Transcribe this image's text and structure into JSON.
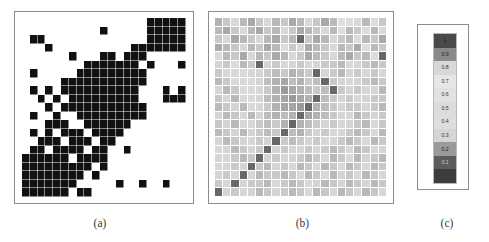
{
  "figure": {
    "background": "#ffffff",
    "panels": [
      {
        "id": "a",
        "caption": "(a)",
        "kind": "binary-adjacency-matrix"
      },
      {
        "id": "b",
        "caption": "(b)",
        "kind": "grayscale-similarity-matrix"
      },
      {
        "id": "c",
        "caption": "(c)",
        "kind": "colorbar-legend"
      }
    ]
  },
  "colors": {
    "frame_border": "#8c8c8c",
    "binary_on": "#111111",
    "binary_off": "#ffffff",
    "grid_line": "#ffffff",
    "caption_text": "#3a3a3a"
  },
  "chart_data": [
    {
      "type": "heatmap",
      "panel": "a",
      "title": "(a)",
      "subtitle": "",
      "xlabel": "",
      "ylabel": "",
      "legend_position": "none",
      "grid": true,
      "colormap": "binary",
      "value_labels": {
        "0": "absent",
        "1": "present"
      },
      "zlim": [
        0,
        1
      ],
      "rows": 21,
      "cols": 21,
      "x": [
        1,
        2,
        3,
        4,
        5,
        6,
        7,
        8,
        9,
        10,
        11,
        12,
        13,
        14,
        15,
        16,
        17,
        18,
        19,
        20,
        21
      ],
      "y": [
        1,
        2,
        3,
        4,
        5,
        6,
        7,
        8,
        9,
        10,
        11,
        12,
        13,
        14,
        15,
        16,
        17,
        18,
        19,
        20,
        21
      ],
      "values": [
        [
          0,
          0,
          0,
          0,
          0,
          0,
          0,
          0,
          0,
          0,
          0,
          0,
          0,
          0,
          0,
          0,
          1,
          1,
          1,
          1,
          1
        ],
        [
          0,
          0,
          0,
          0,
          0,
          0,
          0,
          0,
          0,
          0,
          1,
          0,
          0,
          0,
          0,
          0,
          1,
          1,
          1,
          1,
          1
        ],
        [
          0,
          1,
          1,
          0,
          0,
          0,
          0,
          0,
          0,
          0,
          0,
          0,
          0,
          0,
          0,
          0,
          1,
          1,
          1,
          1,
          1
        ],
        [
          0,
          0,
          0,
          1,
          0,
          0,
          0,
          0,
          0,
          0,
          0,
          0,
          0,
          0,
          1,
          1,
          1,
          1,
          1,
          1,
          1
        ],
        [
          0,
          0,
          0,
          0,
          0,
          0,
          1,
          0,
          0,
          0,
          1,
          1,
          0,
          1,
          1,
          1,
          0,
          0,
          0,
          0,
          0
        ],
        [
          0,
          0,
          0,
          0,
          0,
          0,
          0,
          0,
          1,
          1,
          1,
          1,
          1,
          1,
          1,
          0,
          1,
          0,
          0,
          0,
          1
        ],
        [
          0,
          1,
          0,
          0,
          0,
          0,
          0,
          1,
          1,
          1,
          1,
          1,
          1,
          1,
          1,
          1,
          0,
          0,
          0,
          0,
          0
        ],
        [
          0,
          0,
          0,
          0,
          0,
          1,
          1,
          1,
          1,
          1,
          1,
          1,
          1,
          1,
          1,
          1,
          0,
          0,
          0,
          0,
          0
        ],
        [
          0,
          1,
          0,
          1,
          0,
          1,
          1,
          1,
          1,
          1,
          1,
          1,
          1,
          1,
          1,
          0,
          0,
          0,
          1,
          0,
          1
        ],
        [
          0,
          0,
          1,
          0,
          1,
          0,
          1,
          1,
          1,
          1,
          1,
          1,
          1,
          1,
          1,
          0,
          0,
          0,
          1,
          1,
          1
        ],
        [
          0,
          0,
          0,
          1,
          0,
          1,
          1,
          1,
          1,
          1,
          1,
          1,
          1,
          1,
          1,
          1,
          0,
          0,
          0,
          0,
          0
        ],
        [
          0,
          1,
          0,
          0,
          1,
          0,
          0,
          1,
          1,
          1,
          1,
          1,
          1,
          1,
          1,
          1,
          0,
          0,
          0,
          0,
          0
        ],
        [
          0,
          0,
          0,
          1,
          1,
          1,
          0,
          0,
          1,
          1,
          1,
          1,
          1,
          1,
          0,
          0,
          0,
          0,
          0,
          0,
          0
        ],
        [
          0,
          1,
          0,
          1,
          0,
          1,
          1,
          1,
          0,
          1,
          1,
          1,
          1,
          0,
          0,
          0,
          0,
          0,
          0,
          0,
          0
        ],
        [
          0,
          0,
          1,
          1,
          1,
          0,
          1,
          1,
          1,
          0,
          1,
          1,
          0,
          0,
          0,
          0,
          0,
          0,
          0,
          0,
          0
        ],
        [
          0,
          1,
          1,
          0,
          1,
          1,
          1,
          1,
          0,
          1,
          1,
          0,
          0,
          1,
          0,
          0,
          0,
          0,
          0,
          0,
          0
        ],
        [
          1,
          1,
          1,
          1,
          1,
          1,
          0,
          1,
          1,
          1,
          1,
          0,
          0,
          0,
          0,
          0,
          0,
          0,
          0,
          0,
          0
        ],
        [
          1,
          1,
          1,
          1,
          1,
          1,
          1,
          1,
          1,
          0,
          1,
          0,
          0,
          0,
          0,
          0,
          0,
          0,
          0,
          0,
          0
        ],
        [
          1,
          1,
          1,
          1,
          1,
          1,
          1,
          1,
          0,
          1,
          0,
          0,
          0,
          0,
          0,
          0,
          0,
          0,
          0,
          0,
          0
        ],
        [
          1,
          1,
          1,
          1,
          1,
          1,
          1,
          0,
          0,
          0,
          0,
          0,
          1,
          0,
          0,
          1,
          0,
          0,
          1,
          0,
          0
        ],
        [
          1,
          1,
          1,
          1,
          1,
          1,
          0,
          1,
          1,
          0,
          0,
          0,
          0,
          0,
          0,
          0,
          0,
          0,
          0,
          0,
          0
        ]
      ]
    },
    {
      "type": "heatmap",
      "panel": "b",
      "title": "(b)",
      "subtitle": "",
      "xlabel": "",
      "ylabel": "",
      "legend_position": "right-panel-c",
      "grid": true,
      "colormap": "inverted-gray (1.0 = dark, 0 = dark, mid = light)",
      "zlim": [
        0,
        1
      ],
      "rows": 21,
      "cols": 21,
      "x": [
        1,
        2,
        3,
        4,
        5,
        6,
        7,
        8,
        9,
        10,
        11,
        12,
        13,
        14,
        15,
        16,
        17,
        18,
        19,
        20,
        21
      ],
      "y": [
        1,
        2,
        3,
        4,
        5,
        6,
        7,
        8,
        9,
        10,
        11,
        12,
        13,
        14,
        15,
        16,
        17,
        18,
        19,
        20,
        21
      ],
      "values": [
        [
          0.85,
          0.82,
          0.8,
          0.84,
          0.86,
          0.82,
          0.8,
          0.84,
          0.82,
          0.86,
          0.84,
          0.8,
          0.82,
          0.86,
          0.84,
          0.55,
          0.52,
          0.8,
          0.84,
          0.5,
          0.82
        ],
        [
          0.84,
          0.86,
          0.82,
          0.8,
          0.84,
          0.86,
          0.82,
          0.84,
          0.8,
          0.82,
          0.86,
          0.84,
          0.82,
          0.8,
          0.84,
          0.52,
          0.84,
          0.82,
          0.5,
          0.84,
          0.8
        ],
        [
          0.82,
          0.8,
          0.86,
          0.84,
          0.82,
          0.8,
          0.84,
          0.86,
          0.82,
          0.84,
          0.12,
          0.82,
          0.86,
          0.84,
          0.8,
          0.82,
          0.84,
          0.5,
          0.84,
          0.82,
          0.86
        ],
        [
          0.86,
          0.84,
          0.82,
          0.8,
          0.84,
          0.82,
          0.86,
          0.84,
          0.45,
          0.82,
          0.8,
          0.86,
          0.84,
          0.82,
          0.8,
          0.84,
          0.82,
          0.86,
          0.5,
          0.84,
          0.82
        ],
        [
          0.35,
          0.84,
          0.82,
          0.86,
          0.8,
          0.84,
          0.82,
          0.86,
          0.84,
          0.8,
          0.82,
          0.86,
          0.84,
          0.82,
          0.8,
          0.84,
          0.86,
          0.82,
          0.84,
          0.5,
          0.12
        ],
        [
          0.3,
          0.82,
          0.38,
          0.84,
          0.82,
          0.12,
          0.3,
          0.28,
          0.32,
          0.3,
          0.28,
          0.32,
          0.3,
          0.28,
          0.82,
          0.84,
          0.8,
          0.3,
          0.28,
          0.84,
          0.82
        ],
        [
          0.82,
          0.34,
          0.8,
          0.36,
          0.32,
          0.3,
          0.28,
          0.26,
          0.28,
          0.24,
          0.26,
          0.28,
          0.12,
          0.3,
          0.28,
          0.84,
          0.3,
          0.28,
          0.32,
          0.82,
          0.8
        ],
        [
          0.84,
          0.82,
          0.36,
          0.8,
          0.34,
          0.3,
          0.26,
          0.24,
          0.22,
          0.26,
          0.24,
          0.28,
          0.26,
          0.12,
          0.28,
          0.3,
          0.32,
          0.3,
          0.28,
          0.84,
          0.82
        ],
        [
          0.3,
          0.84,
          0.82,
          0.36,
          0.8,
          0.32,
          0.28,
          0.24,
          0.2,
          0.22,
          0.24,
          0.26,
          0.28,
          0.26,
          0.12,
          0.28,
          0.3,
          0.28,
          0.32,
          0.3,
          0.84
        ],
        [
          0.82,
          0.32,
          0.84,
          0.8,
          0.34,
          0.3,
          0.26,
          0.24,
          0.22,
          0.2,
          0.22,
          0.24,
          0.12,
          0.26,
          0.28,
          0.3,
          0.28,
          0.32,
          0.3,
          0.28,
          0.82
        ],
        [
          0.84,
          0.82,
          0.3,
          0.84,
          0.8,
          0.32,
          0.28,
          0.24,
          0.22,
          0.22,
          0.2,
          0.12,
          0.24,
          0.26,
          0.28,
          0.3,
          0.28,
          0.82,
          0.3,
          0.28,
          0.84
        ],
        [
          0.3,
          0.84,
          0.82,
          0.32,
          0.84,
          0.3,
          0.26,
          0.24,
          0.26,
          0.24,
          0.12,
          0.22,
          0.24,
          0.26,
          0.28,
          0.3,
          0.32,
          0.84,
          0.82,
          0.3,
          0.28
        ],
        [
          0.82,
          0.3,
          0.84,
          0.8,
          0.32,
          0.28,
          0.26,
          0.28,
          0.24,
          0.12,
          0.24,
          0.26,
          0.28,
          0.3,
          0.28,
          0.32,
          0.3,
          0.82,
          0.84,
          0.8,
          0.82
        ],
        [
          0.84,
          0.82,
          0.3,
          0.84,
          0.3,
          0.28,
          0.26,
          0.28,
          0.12,
          0.26,
          0.24,
          0.28,
          0.3,
          0.28,
          0.32,
          0.3,
          0.28,
          0.84,
          0.82,
          0.8,
          0.84
        ],
        [
          0.3,
          0.84,
          0.82,
          0.3,
          0.32,
          0.28,
          0.3,
          0.12,
          0.28,
          0.26,
          0.28,
          0.3,
          0.28,
          0.32,
          0.3,
          0.28,
          0.84,
          0.82,
          0.8,
          0.84,
          0.82
        ],
        [
          0.32,
          0.3,
          0.84,
          0.82,
          0.3,
          0.28,
          0.12,
          0.3,
          0.28,
          0.3,
          0.32,
          0.28,
          0.3,
          0.28,
          0.84,
          0.82,
          0.8,
          0.84,
          0.82,
          0.8,
          0.3
        ],
        [
          0.3,
          0.32,
          0.28,
          0.84,
          0.82,
          0.12,
          0.3,
          0.28,
          0.32,
          0.3,
          0.28,
          0.84,
          0.82,
          0.8,
          0.84,
          0.82,
          0.8,
          0.84,
          0.3,
          0.82,
          0.84
        ],
        [
          0.32,
          0.3,
          0.28,
          0.3,
          0.12,
          0.82,
          0.84,
          0.3,
          0.28,
          0.32,
          0.84,
          0.82,
          0.8,
          0.84,
          0.82,
          0.8,
          0.84,
          0.82,
          0.8,
          0.84,
          0.82
        ],
        [
          0.3,
          0.28,
          0.32,
          0.12,
          0.3,
          0.84,
          0.82,
          0.28,
          0.84,
          0.82,
          0.8,
          0.84,
          0.82,
          0.8,
          0.84,
          0.3,
          0.82,
          0.8,
          0.84,
          0.82,
          0.8
        ],
        [
          0.28,
          0.32,
          0.12,
          0.3,
          0.28,
          0.82,
          0.84,
          0.8,
          0.82,
          0.84,
          0.82,
          0.8,
          0.3,
          0.84,
          0.82,
          0.3,
          0.84,
          0.82,
          0.3,
          0.84,
          0.82
        ],
        [
          0.12,
          0.3,
          0.28,
          0.32,
          0.3,
          0.84,
          0.82,
          0.3,
          0.28,
          0.84,
          0.82,
          0.8,
          0.84,
          0.82,
          0.8,
          0.84,
          0.82,
          0.8,
          0.84,
          0.82,
          0.8
        ]
      ]
    },
    {
      "type": "colorbar",
      "panel": "c",
      "title": "(c)",
      "orientation": "vertical",
      "zlim": [
        0,
        1
      ],
      "tick_labels": [
        "1",
        "0.9",
        "0.8",
        "0.7",
        "0.6",
        "0.5",
        "0.4",
        "0.3",
        "0.2",
        "0.1",
        "0"
      ],
      "swatches": [
        {
          "label": "1",
          "value": 1.0,
          "color": "#4a4a4a",
          "text_color": "#1a1a1a"
        },
        {
          "label": "0.9",
          "value": 0.9,
          "color": "#8a8a8a",
          "text_color": "#1a1a1a"
        },
        {
          "label": "0.8",
          "value": 0.8,
          "color": "#d8d8d8",
          "text_color": "#333333"
        },
        {
          "label": "0.7",
          "value": 0.7,
          "color": "#e6e6e6",
          "text_color": "#333333"
        },
        {
          "label": "0.6",
          "value": 0.6,
          "color": "#e2e2e2",
          "text_color": "#333333"
        },
        {
          "label": "0.5",
          "value": 0.5,
          "color": "#dcdcdc",
          "text_color": "#333333"
        },
        {
          "label": "0.4",
          "value": 0.4,
          "color": "#dedede",
          "text_color": "#333333"
        },
        {
          "label": "0.3",
          "value": 0.3,
          "color": "#d5d5d5",
          "text_color": "#333333"
        },
        {
          "label": "0.2",
          "value": 0.2,
          "color": "#9a9a9a",
          "text_color": "#1a1a1a"
        },
        {
          "label": "0.1",
          "value": 0.1,
          "color": "#5c5c5c",
          "text_color": "#d0d0d0"
        },
        {
          "label": "0",
          "value": 0.0,
          "color": "#3c3c3c",
          "text_color": "#3c3c3c"
        }
      ]
    }
  ]
}
